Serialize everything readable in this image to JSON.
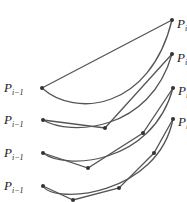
{
  "diagram": {
    "colors": {
      "stroke": "#555555",
      "point": "#333333",
      "text": "#222222"
    },
    "labels": {
      "start_main": "P",
      "start_sub": "i−1",
      "end_main": "P",
      "end_sub": "i"
    },
    "panels": [
      {
        "name": "panel-1-subdivisions",
        "curve": "M42,88 C75,118 150,110 172,20",
        "polyline": [
          [
            42,
            88
          ],
          [
            172,
            20
          ]
        ],
        "start_label_y": 92,
        "end_label_y": 28
      },
      {
        "name": "panel-2-subdivisions",
        "curve": "M43,120 C70,136 150,132 172,54",
        "polyline": [
          [
            43,
            120
          ],
          [
            105,
            128
          ],
          [
            172,
            54
          ]
        ],
        "start_label_y": 124,
        "end_label_y": 62
      },
      {
        "name": "panel-3-subdivisions",
        "curve": "M43,153 C65,170 152,165 173,88",
        "polyline": [
          [
            43,
            153
          ],
          [
            88,
            168
          ],
          [
            143,
            133
          ],
          [
            173,
            88
          ]
        ],
        "start_label_y": 157,
        "end_label_y": 95
      },
      {
        "name": "panel-4-subdivisions",
        "curve": "M43,186 C55,205 158,195 173,119",
        "polyline": [
          [
            43,
            186
          ],
          [
            73,
            200
          ],
          [
            119,
            188
          ],
          [
            154,
            153
          ],
          [
            173,
            119
          ]
        ],
        "start_label_y": 190,
        "end_label_y": 126
      }
    ]
  }
}
